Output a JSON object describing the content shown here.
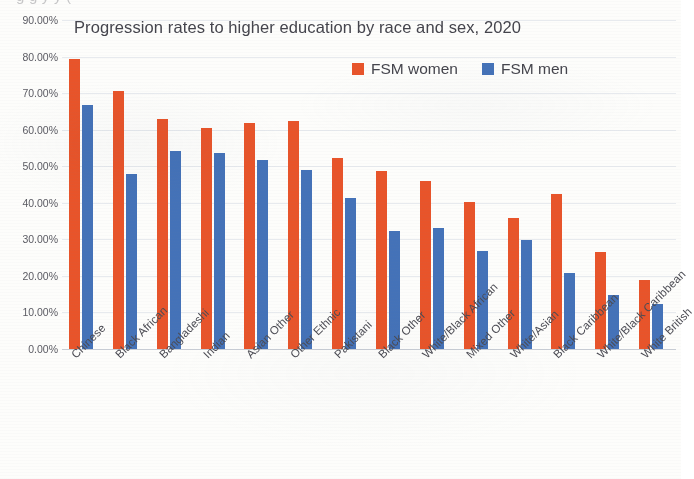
{
  "scan": {
    "cutoff_top_text": "g g y y ("
  },
  "chart_data": {
    "type": "bar",
    "title": "Progression rates to higher education by race and sex, 2020",
    "xlabel": "",
    "ylabel": "",
    "ylim": [
      0,
      90
    ],
    "grid": true,
    "legend_position": "top-right",
    "ytick_labels": [
      "90.00%",
      "80.00%",
      "70.00%",
      "60.00%",
      "50.00%",
      "40.00%",
      "30.00%",
      "20.00%",
      "10.00%",
      "0.00%"
    ],
    "ytick_values": [
      90,
      80,
      70,
      60,
      50,
      40,
      30,
      20,
      10,
      0
    ],
    "categories": [
      "Chinese",
      "Black African",
      "Bangladeshi",
      "Indian",
      "Asian Other",
      "Other Ethnic",
      "Pakistani",
      "Black Other",
      "White/Black African",
      "Mixed Other",
      "White/Asian",
      "Black Caribbean",
      "White/Black Caribbean",
      "White British"
    ],
    "series": [
      {
        "name": "FSM women",
        "color": "#e8542a",
        "values": [
          79.3,
          70.7,
          63.0,
          60.4,
          61.8,
          62.5,
          52.2,
          48.8,
          45.9,
          40.1,
          35.8,
          42.3,
          26.6,
          19.0
        ]
      },
      {
        "name": "FSM men",
        "color": "#4472b8",
        "values": [
          66.8,
          47.8,
          54.1,
          53.7,
          51.8,
          49.0,
          41.3,
          32.3,
          33.2,
          26.7,
          29.8,
          20.8,
          14.7,
          12.2
        ]
      }
    ],
    "legend": [
      "FSM women",
      "FSM men"
    ]
  }
}
